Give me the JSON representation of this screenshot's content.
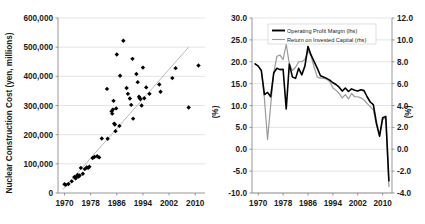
{
  "figure": {
    "background_color": "#ffffff",
    "panels": [
      "nuclear-construction-cost-scatter",
      "profitability-line-chart"
    ]
  },
  "chart_data": [
    {
      "id": "nuclear-construction-cost-scatter",
      "type": "scatter",
      "title": "",
      "xlabel": "",
      "ylabel": "Nuclear Construction Cost (yen, millions)",
      "xlim": [
        1968,
        2013
      ],
      "ylim": [
        0,
        600000
      ],
      "xticks": [
        1970,
        1978,
        1986,
        1994,
        2002,
        2010
      ],
      "xtick_labels": [
        "1970",
        "1978",
        "1986",
        "1994",
        "2002",
        "2010"
      ],
      "yticks": [
        0,
        100000,
        200000,
        300000,
        400000,
        500000,
        600000
      ],
      "ytick_labels": [
        "0",
        "100,000",
        "200,000",
        "300,000",
        "400,000",
        "500,000",
        "600,000"
      ],
      "grid": "horizontal",
      "marker_color": "#000000",
      "marker": "diamond",
      "trendline": {
        "color": "#b0b0b0",
        "x": [
          1969.5,
          2008.0
        ],
        "y": [
          12000,
          500000
        ]
      },
      "points": [
        {
          "x": 1970.0,
          "y": 30000
        },
        {
          "x": 1970.4,
          "y": 28000
        },
        {
          "x": 1971.2,
          "y": 31000
        },
        {
          "x": 1972.2,
          "y": 40000
        },
        {
          "x": 1973.0,
          "y": 55000
        },
        {
          "x": 1973.4,
          "y": 50000
        },
        {
          "x": 1973.8,
          "y": 58000
        },
        {
          "x": 1974.0,
          "y": 62000
        },
        {
          "x": 1974.3,
          "y": 56000
        },
        {
          "x": 1974.6,
          "y": 60000
        },
        {
          "x": 1975.0,
          "y": 86000
        },
        {
          "x": 1975.6,
          "y": 66000
        },
        {
          "x": 1976.2,
          "y": 82000
        },
        {
          "x": 1976.8,
          "y": 88000
        },
        {
          "x": 1977.2,
          "y": 86000
        },
        {
          "x": 1977.6,
          "y": 90000
        },
        {
          "x": 1978.6,
          "y": 120000
        },
        {
          "x": 1979.2,
          "y": 124000
        },
        {
          "x": 1980.0,
          "y": 126000
        },
        {
          "x": 1980.6,
          "y": 122000
        },
        {
          "x": 1981.4,
          "y": 187000
        },
        {
          "x": 1983.2,
          "y": 186000
        },
        {
          "x": 1983.0,
          "y": 357000
        },
        {
          "x": 1984.4,
          "y": 280000
        },
        {
          "x": 1984.6,
          "y": 272000
        },
        {
          "x": 1984.8,
          "y": 286000
        },
        {
          "x": 1985.0,
          "y": 316000
        },
        {
          "x": 1985.2,
          "y": 238000
        },
        {
          "x": 1985.4,
          "y": 235000
        },
        {
          "x": 1985.6,
          "y": 212000
        },
        {
          "x": 1985.8,
          "y": 290000
        },
        {
          "x": 1986.0,
          "y": 475000
        },
        {
          "x": 1986.8,
          "y": 230000
        },
        {
          "x": 1987.0,
          "y": 402000
        },
        {
          "x": 1988.0,
          "y": 522000
        },
        {
          "x": 1989.0,
          "y": 360000
        },
        {
          "x": 1989.4,
          "y": 340000
        },
        {
          "x": 1990.0,
          "y": 324000
        },
        {
          "x": 1990.4,
          "y": 302000
        },
        {
          "x": 1990.8,
          "y": 460000
        },
        {
          "x": 1991.0,
          "y": 255000
        },
        {
          "x": 1992.0,
          "y": 408000
        },
        {
          "x": 1992.4,
          "y": 380000
        },
        {
          "x": 1992.8,
          "y": 330000
        },
        {
          "x": 1993.0,
          "y": 326000
        },
        {
          "x": 1993.2,
          "y": 322000
        },
        {
          "x": 1993.6,
          "y": 300000
        },
        {
          "x": 1994.0,
          "y": 430000
        },
        {
          "x": 1994.4,
          "y": 325000
        },
        {
          "x": 1995.0,
          "y": 362000
        },
        {
          "x": 1996.0,
          "y": 340000
        },
        {
          "x": 1999.0,
          "y": 372000
        },
        {
          "x": 1999.4,
          "y": 347000
        },
        {
          "x": 2003.0,
          "y": 394000
        },
        {
          "x": 2004.0,
          "y": 428000
        },
        {
          "x": 2008.0,
          "y": 293000
        },
        {
          "x": 2011.0,
          "y": 437000
        }
      ]
    },
    {
      "id": "profitability-line-chart",
      "type": "line",
      "title": "",
      "xlabel": "",
      "ylabel_left": "(%)",
      "ylabel_right": "(%)",
      "xlim": [
        1968,
        2013
      ],
      "ylim_left": [
        -10.0,
        30.0
      ],
      "ylim_right": [
        -4.0,
        12.0
      ],
      "xticks": [
        1970,
        1978,
        1986,
        1994,
        2002,
        2010
      ],
      "xtick_labels": [
        "1970",
        "1978",
        "1986",
        "1994",
        "2002",
        "2010"
      ],
      "yticks_left": [
        -10.0,
        -5.0,
        0.0,
        5.0,
        10.0,
        15.0,
        20.0,
        25.0,
        30.0
      ],
      "ytick_labels_left": [
        "-10.0",
        "-5.0",
        "0.0",
        "5.0",
        "10.0",
        "15.0",
        "20.0",
        "25.0",
        "30.0"
      ],
      "yticks_right": [
        -4.0,
        -2.0,
        0.0,
        2.0,
        4.0,
        6.0,
        8.0,
        10.0,
        12.0
      ],
      "ytick_labels_right": [
        "-4.0",
        "-2.0",
        "0.0",
        "2.0",
        "4.0",
        "6.0",
        "8.0",
        "10.0",
        "12.0"
      ],
      "grid": "horizontal",
      "legend_position": "top-center",
      "series": [
        {
          "name": "Operating Profit Margin (lhs)",
          "axis": "left",
          "color": "#000000",
          "width": 1.6,
          "x": [
            1969,
            1970,
            1971,
            1972,
            1973,
            1974,
            1975,
            1976,
            1977,
            1978,
            1979,
            1980,
            1981,
            1982,
            1983,
            1984,
            1985,
            1986,
            1987,
            1988,
            1989,
            1990,
            1991,
            1992,
            1993,
            1994,
            1995,
            1996,
            1997,
            1998,
            1999,
            2000,
            2001,
            2002,
            2003,
            2004,
            2005,
            2006,
            2007,
            2008,
            2009,
            2010,
            2011,
            2012
          ],
          "values": [
            19.5,
            19.0,
            18.0,
            12.5,
            13.0,
            12.0,
            17.5,
            18.5,
            18.2,
            18.3,
            9.2,
            19.5,
            16.5,
            16.2,
            18.5,
            17.0,
            19.0,
            23.5,
            21.5,
            20.0,
            18.5,
            16.8,
            16.5,
            16.2,
            15.8,
            15.2,
            14.8,
            14.2,
            13.3,
            14.0,
            13.2,
            13.8,
            13.5,
            13.3,
            13.6,
            13.4,
            12.0,
            10.8,
            10.2,
            6.0,
            3.0,
            7.2,
            7.5,
            -7.2
          ]
        },
        {
          "name": "Return on Invested Capital (rhs)",
          "axis": "right",
          "color": "#9a9a9a",
          "width": 1.2,
          "x": [
            1969,
            1970,
            1971,
            1972,
            1973,
            1974,
            1975,
            1976,
            1977,
            1978,
            1979,
            1980,
            1981,
            1982,
            1983,
            1984,
            1985,
            1986,
            1987,
            1988,
            1989,
            1990,
            1991,
            1992,
            1993,
            1994,
            1995,
            1996,
            1997,
            1998,
            1999,
            2000,
            2001,
            2002,
            2003,
            2004,
            2005,
            2006,
            2007,
            2008,
            2009,
            2010,
            2011,
            2012
          ],
          "values": [
            7.8,
            7.6,
            7.2,
            4.6,
            0.9,
            4.0,
            7.0,
            8.5,
            8.6,
            8.2,
            9.6,
            7.8,
            7.2,
            7.5,
            8.0,
            8.0,
            8.2,
            9.0,
            8.5,
            7.5,
            6.6,
            6.5,
            6.5,
            6.4,
            6.2,
            5.6,
            5.4,
            5.1,
            4.7,
            5.0,
            4.6,
            5.1,
            4.8,
            4.8,
            4.7,
            4.5,
            4.2,
            3.9,
            3.6,
            2.2,
            1.2,
            2.7,
            2.9,
            -3.4
          ]
        }
      ]
    }
  ],
  "left_chart": {
    "y_axis_title": "Nuclear Construction Cost (yen, millions)",
    "y_tick_labels": [
      "600,000",
      "500,000",
      "400,000",
      "300,000",
      "200,000",
      "100,000",
      "0"
    ],
    "x_tick_labels": [
      "1970",
      "1978",
      "1986",
      "1994",
      "2002",
      "2010"
    ]
  },
  "right_chart": {
    "y_axis_title_left": "(%)",
    "y_axis_title_right": "(%)",
    "y_tick_labels_left": [
      "30.0",
      "25.0",
      "20.0",
      "15.0",
      "10.0",
      "5.0",
      "0.0",
      "-5.0",
      "-10.0"
    ],
    "y_tick_labels_right": [
      "12.0",
      "10.0",
      "8.0",
      "6.0",
      "4.0",
      "2.0",
      "0.0",
      "-2.0",
      "-4.0"
    ],
    "x_tick_labels": [
      "1970",
      "1978",
      "1986",
      "1994",
      "2002",
      "2010"
    ],
    "legend": [
      {
        "label": "Operating Profit Margin (lhs)",
        "color": "#000000",
        "width": 1.9
      },
      {
        "label": "Return on Invested Capital (rhs)",
        "color": "#9a9a9a",
        "width": 1.1
      }
    ]
  }
}
